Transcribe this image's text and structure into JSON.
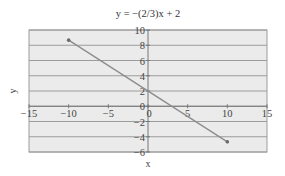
{
  "chart_data": {
    "type": "line",
    "title": "y = −(2/3)x + 2",
    "xlabel": "x",
    "ylabel": "y",
    "xlim": [
      -15,
      15
    ],
    "ylim": [
      -6,
      10
    ],
    "x_ticks": [
      -15,
      -10,
      -5,
      0,
      5,
      10,
      15
    ],
    "x_tick_labels": [
      "−15",
      "−10",
      "−5",
      "0",
      "5",
      "10",
      "15"
    ],
    "y_ticks": [
      10,
      8,
      6,
      4,
      2,
      0,
      -2,
      -4,
      -6
    ],
    "y_tick_labels": [
      "10",
      "8",
      "6",
      "4",
      "2",
      "0",
      "−2",
      "−4",
      "−6"
    ],
    "grid": {
      "horizontal": true,
      "vertical": false
    },
    "legend": null,
    "series": [
      {
        "name": "y = -(2/3)x + 2",
        "x": [
          -10,
          10
        ],
        "y": [
          8.67,
          -4.67
        ],
        "markers": true
      }
    ],
    "colors": {
      "plot_background": "#ebebeb",
      "gridline": "#9c9c9c",
      "axis": "#777777",
      "line": "#8c8c8c",
      "marker": "#6a6a6a"
    }
  }
}
